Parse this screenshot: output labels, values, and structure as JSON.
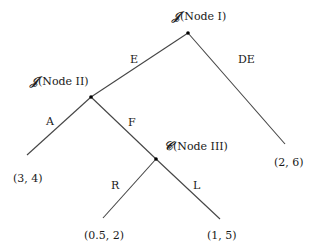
{
  "diagram": {
    "type": "game-tree",
    "nodes": [
      {
        "id": "node-1",
        "symbol": "𝒥",
        "label": "(Node I)",
        "x": 188,
        "y": 33
      },
      {
        "id": "node-2",
        "symbol": "𝒥",
        "label": "(Node II)",
        "x": 91,
        "y": 97
      },
      {
        "id": "node-3",
        "symbol": "𝒞",
        "label": "(Node III)",
        "x": 156,
        "y": 159
      }
    ],
    "edges": [
      {
        "from": "node-1",
        "to": "node-2",
        "label": "E"
      },
      {
        "from": "node-1",
        "to": "leaf-2-6",
        "label": "DE"
      },
      {
        "from": "node-2",
        "to": "leaf-3-4",
        "label": "A"
      },
      {
        "from": "node-2",
        "to": "node-3",
        "label": "F"
      },
      {
        "from": "node-3",
        "to": "leaf-0.5-2",
        "label": "R"
      },
      {
        "from": "node-3",
        "to": "leaf-1-5",
        "label": "L"
      }
    ],
    "leaves": [
      {
        "id": "leaf-3-4",
        "payoff": "(3, 4)"
      },
      {
        "id": "leaf-2-6",
        "payoff": "(2, 6)"
      },
      {
        "id": "leaf-0.5-2",
        "payoff": "(0.5, 2)"
      },
      {
        "id": "leaf-1-5",
        "payoff": "(1, 5)"
      }
    ]
  }
}
